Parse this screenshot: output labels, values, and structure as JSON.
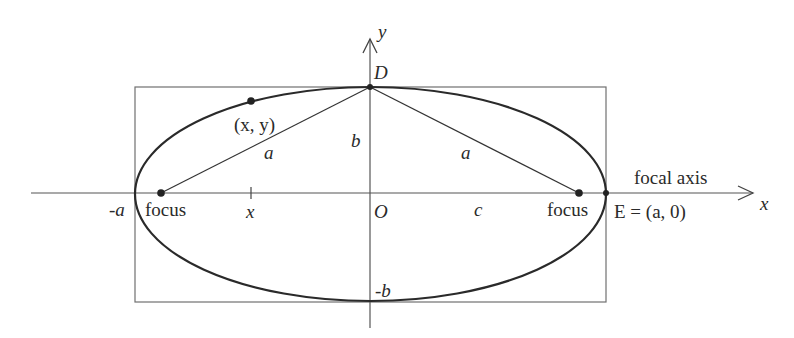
{
  "diagram": {
    "type": "ellipse-geometry",
    "colors": {
      "stroke": "#2a2a2a",
      "frame": "#666666",
      "background": "#ffffff"
    },
    "axes": {
      "x_label": "x",
      "y_label": "y",
      "focal_axis_label": "focal axis"
    },
    "points": {
      "origin": "O",
      "top_vertex": "D",
      "right_vertex": "E = (a, 0)",
      "generic_point": "(x, y)",
      "left_focus": "focus",
      "right_focus": "focus"
    },
    "labels": {
      "neg_a": "-a",
      "neg_b": "-b",
      "b": "b",
      "a_left": "a",
      "a_right": "a",
      "c": "c",
      "x_tick": "x"
    }
  }
}
